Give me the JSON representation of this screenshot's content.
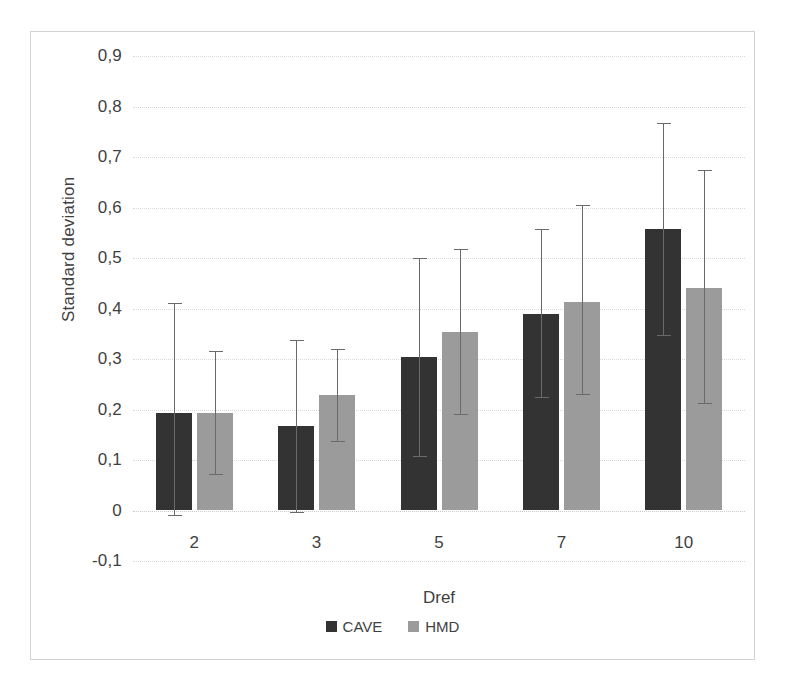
{
  "chart_data": {
    "type": "bar",
    "title": "",
    "xlabel": "Dref",
    "ylabel": "Standard deviation",
    "categories": [
      "2",
      "3",
      "5",
      "7",
      "10"
    ],
    "ylim": [
      -0.1,
      0.9
    ],
    "ytick_labels": [
      "0,9",
      "0,8",
      "0,7",
      "0,6",
      "0,5",
      "0,4",
      "0,3",
      "0,2",
      "0,1",
      "0",
      "-0,1"
    ],
    "ytick_values": [
      0.9,
      0.8,
      0.7,
      0.6,
      0.5,
      0.4,
      0.3,
      0.2,
      0.1,
      0.0,
      -0.1
    ],
    "grid": true,
    "legend_position": "bottom",
    "decimal_separator": ",",
    "series": [
      {
        "name": "CAVE",
        "color": "#333333",
        "values": [
          0.193,
          0.168,
          0.303,
          0.39,
          0.557
        ],
        "error_low": [
          -0.01,
          -0.005,
          0.105,
          0.222,
          0.345
        ],
        "error_high": [
          0.41,
          0.337,
          0.5,
          0.557,
          0.768
        ]
      },
      {
        "name": "HMD",
        "color": "#9b9b9b",
        "values": [
          0.193,
          0.228,
          0.353,
          0.413,
          0.44
        ],
        "error_low": [
          0.07,
          0.135,
          0.19,
          0.228,
          0.21
        ],
        "error_high": [
          0.315,
          0.32,
          0.517,
          0.605,
          0.675
        ]
      }
    ]
  },
  "legend": {
    "entries": [
      {
        "label": "CAVE",
        "swatch": "cave"
      },
      {
        "label": "HMD",
        "swatch": "hmd"
      }
    ]
  },
  "caption": {
    "text": ""
  }
}
